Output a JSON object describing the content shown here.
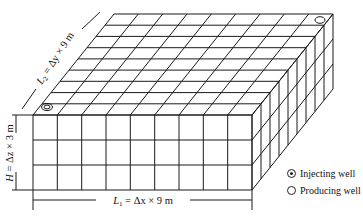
{
  "figure": {
    "type": "3D reservoir grid model",
    "grid": {
      "nx": 9,
      "ny": 9,
      "nz": 3
    },
    "dimensions": {
      "L1": {
        "symbol": "L",
        "sub": "1",
        "eq": " = Δx × 9 m"
      },
      "L2": {
        "symbol": "L",
        "sub": "2",
        "eq": " = Δy × 9 m"
      },
      "H": {
        "symbol": "H",
        "eq": " = Δz × 3 m"
      }
    },
    "wells": [
      {
        "type": "injecting",
        "location": "front-left top corner"
      },
      {
        "type": "producing",
        "location": "back-right top corner"
      }
    ],
    "legend": [
      {
        "symbol": "injecting-well",
        "label": "Injecting well"
      },
      {
        "symbol": "producing-well",
        "label": "Producing well"
      }
    ],
    "colors": {
      "line": "#1a1a1a",
      "background": "#ffffff"
    }
  }
}
